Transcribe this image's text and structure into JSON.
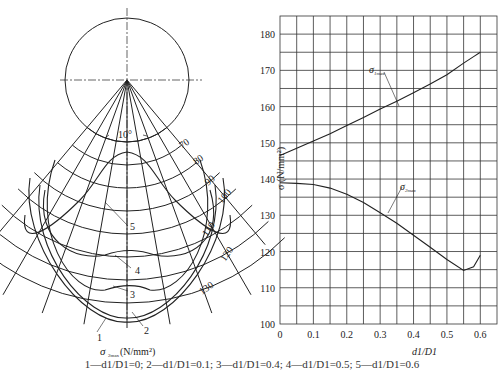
{
  "left_figure": {
    "angle_label": "10°",
    "contour_labels": [
      "70",
      "80",
      "90",
      "100",
      "110",
      "120",
      "130"
    ],
    "curve_labels": [
      "1",
      "2",
      "3",
      "4",
      "5"
    ],
    "axis_label_sigma": "σ",
    "axis_label_sub": "2max",
    "axis_label_unit": "(N/mm²)"
  },
  "chart_data": {
    "type": "line",
    "title": "",
    "xlabel": "d1/D1",
    "ylabel": "σ (N/mm²)",
    "xlim": [
      0,
      0.6
    ],
    "ylim": [
      100,
      180
    ],
    "x_ticks": [
      "0",
      "0.1",
      "0.2",
      "0.3",
      "0.4",
      "0.5",
      "0.6"
    ],
    "y_ticks": [
      "100",
      "110",
      "120",
      "130",
      "140",
      "150",
      "160",
      "170",
      "180"
    ],
    "grid": true,
    "x": [
      0,
      0.05,
      0.1,
      0.15,
      0.2,
      0.25,
      0.3,
      0.35,
      0.4,
      0.45,
      0.5,
      0.55,
      0.58,
      0.6
    ],
    "series": [
      {
        "name": "σ1max",
        "values": [
          146.5,
          148.5,
          150.5,
          152.5,
          154.8,
          157,
          159.3,
          161.5,
          163.8,
          166.2,
          168.8,
          172,
          173.8,
          175
        ]
      },
      {
        "name": "σ2max",
        "values": [
          139,
          138.8,
          138.5,
          137.5,
          135.8,
          133.5,
          130.7,
          127.8,
          124.5,
          121.2,
          117.8,
          114.8,
          115.8,
          119
        ]
      }
    ]
  },
  "caption": {
    "legend_line": "1—d1/D1=0; 2—d1/D1=0.1; 3—d1/D1=0.4; 4—d1/D1=0.5; 5—d1/D1=0.6"
  }
}
